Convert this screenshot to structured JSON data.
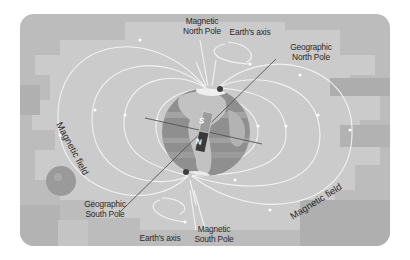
{
  "diagram": {
    "colors": {
      "background": "#ffffff",
      "panel": "#bdbdbd",
      "panel_light": "#cfcfcf",
      "panel_dark": "#a9a9a9",
      "field_lines": "#f4f4f4",
      "globe_ocean": "#8e8e8e",
      "globe_land": "#b9b9b9",
      "axis_line": "#555555",
      "magnet_south": "#9a9a9a",
      "magnet_north": "#3a3a3a",
      "text": "#2a2a2a"
    },
    "labels": {
      "magnetic_north_pole": [
        "Magnetic",
        "North Pole"
      ],
      "earths_axis_top": "Earth's axis",
      "geographic_north_pole": [
        "Geographic",
        "North Pole"
      ],
      "magnetic_field_left": "Magnetic field",
      "magnetic_field_right": "Magnetic field",
      "geographic_south_pole": [
        "Geographic",
        "South Pole"
      ],
      "earths_axis_bottom": "Earth's axis",
      "magnetic_south_pole": [
        "Magnetic",
        "South Pole"
      ]
    },
    "magnet": {
      "south_label": "S",
      "north_label": "N"
    }
  }
}
